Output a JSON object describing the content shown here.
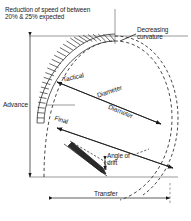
{
  "diagram": {
    "annotations": {
      "speed_note_line1": "Reduction of speed of between",
      "speed_note_line2": "20% & 25% expected",
      "curvature_line1": "Decreasing",
      "curvature_line2": "curvature",
      "advance": "Advance",
      "transfer": "Transfer",
      "tactical": "Tactical",
      "diameter_upper": "Diameter",
      "final": "Final",
      "diameter_lower": "Diameter",
      "drift_line1": "Angle of",
      "drift_line2": "drift"
    },
    "colors": {
      "stroke": "#1b1b1b",
      "background": "#ffffff",
      "hatch": "#3a3a3a"
    }
  }
}
